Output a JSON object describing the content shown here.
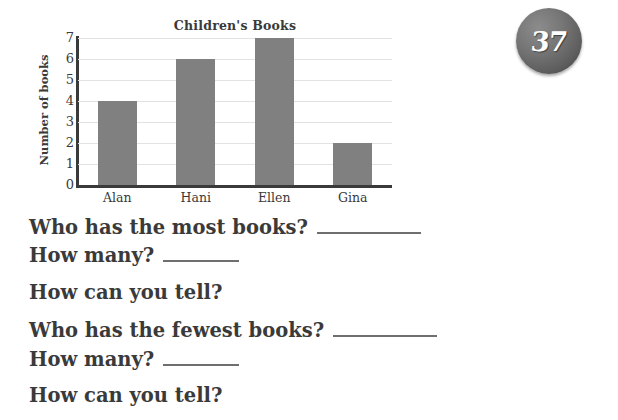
{
  "page": {
    "number": "37",
    "badge_color": "#5e5e5e",
    "text_color": "#3a3a3a"
  },
  "chart_data": {
    "type": "bar",
    "title": "Children's Books",
    "xlabel": "",
    "ylabel": "Number of books",
    "categories": [
      "Alan",
      "Hani",
      "Ellen",
      "Gina"
    ],
    "values": [
      4,
      6,
      7,
      2
    ],
    "ylim": [
      0,
      7
    ],
    "yticks": [
      "0",
      "1",
      "2",
      "3",
      "4",
      "5",
      "6",
      "7"
    ],
    "grid": true,
    "legend": false,
    "bar_color": "#808080",
    "gridline_color": "#e2e2e2",
    "axis_color": "#3a3a3a"
  },
  "questions": [
    {
      "text": "Who has the most books?",
      "rule": "long"
    },
    {
      "text": "How many?",
      "rule": "short"
    },
    {
      "text": "How can you tell?",
      "rule": "none"
    },
    {
      "text": "Who has the fewest books?",
      "rule": "long"
    },
    {
      "text": "How many?",
      "rule": "short"
    },
    {
      "text": "How can you tell?",
      "rule": "none"
    }
  ]
}
